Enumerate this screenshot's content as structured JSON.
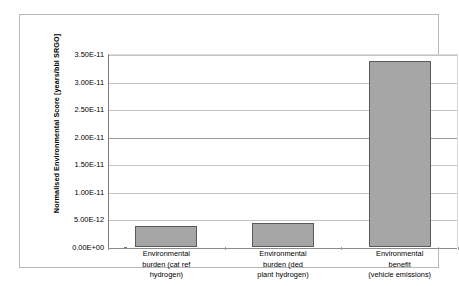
{
  "chart_data": {
    "type": "bar",
    "title": "",
    "xlabel": "",
    "ylabel": "Normalised Environmental Score [years/bbl SRGO]",
    "categories": [
      "Environmental burden (cat ref hydrogen)",
      "Environmental burden (ded plant hydrogen)",
      "Environmental benefit (vehicle emissions)"
    ],
    "category_lines": [
      [
        "Environmental",
        "burden (cat ref",
        "hydrogen)"
      ],
      [
        "Environmental",
        "burden (ded",
        "plant hydrogen)"
      ],
      [
        "Environmental",
        "benefit",
        "(vehicle emissions)"
      ]
    ],
    "values": [
      3.9e-12,
      4.4e-12,
      3.37e-11
    ],
    "ylim": [
      0,
      3.5e-11
    ],
    "yticks": [
      0,
      5e-12,
      1e-11,
      1.5e-11,
      2e-11,
      2.5e-11,
      3e-11,
      3.5e-11
    ],
    "ytick_labels": [
      "0.00E+00",
      "5.00E-12",
      "1.00E-11",
      "1.50E-11",
      "2.00E-11",
      "2.50E-11",
      "3.00E-11",
      "3.50E-11"
    ],
    "grid": true,
    "legend": "none",
    "bar_fill_color": "#a6a6a6",
    "bar_border_color": "#5a5a5a",
    "gridline_color": "#c4c4c4",
    "axis_color": "#7a7a7a",
    "frame_color": "#b8b8b8",
    "background_color": "#ffffff"
  }
}
